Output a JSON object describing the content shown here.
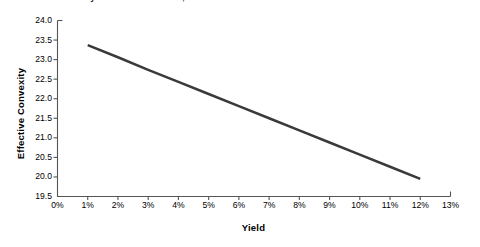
{
  "chart_data": {
    "type": "line",
    "title": "A. Effective Convexity-Yield Curve for a 10%, 20-Year Bond",
    "xlabel": "Yield",
    "ylabel": "Effective Convexity",
    "xlim": [
      0,
      13
    ],
    "ylim": [
      19.5,
      24.0
    ],
    "grid": false,
    "legend": null,
    "x_tick_labels": [
      "0%",
      "1%",
      "2%",
      "3%",
      "4%",
      "5%",
      "6%",
      "7%",
      "8%",
      "9%",
      "10%",
      "11%",
      "12%",
      "13%"
    ],
    "x_tick_values": [
      0,
      1,
      2,
      3,
      4,
      5,
      6,
      7,
      8,
      9,
      10,
      11,
      12,
      13
    ],
    "y_tick_labels": [
      "19.5",
      "20.0",
      "20.5",
      "21.0",
      "21.5",
      "22.0",
      "22.5",
      "23.0",
      "23.5",
      "24.0"
    ],
    "y_tick_values": [
      19.5,
      20.0,
      20.5,
      21.0,
      21.5,
      22.0,
      22.5,
      23.0,
      23.5,
      24.0
    ],
    "series": [
      {
        "name": "Effective Convexity",
        "color": "#3a3a3a",
        "line_width": 2.5,
        "x": [
          1,
          2,
          3,
          4,
          5,
          6,
          7,
          8,
          9,
          10,
          11,
          12
        ],
        "values": [
          23.37,
          23.06,
          22.74,
          22.43,
          22.12,
          21.81,
          21.5,
          21.19,
          20.88,
          20.57,
          20.26,
          19.95
        ]
      }
    ]
  },
  "style": {
    "background": "#ffffff",
    "axis_color": "#555555",
    "text_color": "#000000"
  }
}
